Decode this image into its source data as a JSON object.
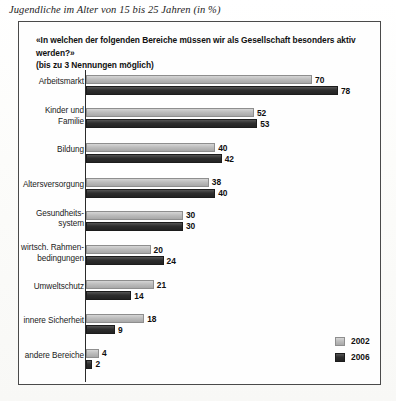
{
  "caption": "Jugendliche im Alter von 15 bis 25 Jahren (in %)",
  "question": {
    "line1": "«In welchen der folgenden Bereiche müssen wir als Gesellschaft besonders aktiv werden?»",
    "line2": "(bis zu 3 Nennungen möglich)"
  },
  "legend": {
    "items": [
      {
        "label": "2002",
        "color": "#bdbdbd"
      },
      {
        "label": "2006",
        "color": "#2e2e2e"
      }
    ]
  },
  "chart_data": {
    "type": "bar",
    "orientation": "horizontal",
    "title": "«In welchen der folgenden Bereiche müssen wir als Gesellschaft besonders aktiv werden?»",
    "subtitle": "(bis zu 3 Nennungen möglich)",
    "caption": "Jugendliche im Alter von 15 bis 25 Jahren (in %)",
    "xlabel": "",
    "ylabel": "",
    "unit": "%",
    "xlim": [
      0,
      78
    ],
    "grid": false,
    "legend_position": "bottom-right",
    "categories": [
      "Arbeitsmarkt",
      "Kinder und Familie",
      "Bildung",
      "Altersversorgung",
      "Gesundheits-system",
      "wirtsch. Rahmen-bedingungen",
      "Umweltschutz",
      "innere Sicherheit",
      "andere Bereiche"
    ],
    "series": [
      {
        "name": "2002",
        "values": [
          70,
          52,
          40,
          38,
          30,
          20,
          21,
          18,
          4
        ]
      },
      {
        "name": "2006",
        "values": [
          78,
          53,
          42,
          40,
          30,
          24,
          14,
          9,
          2
        ]
      }
    ]
  },
  "rows": [
    {
      "label_line1": "Arbeitsmarkt",
      "label_line2": "",
      "v2002": 70,
      "v2006": 78
    },
    {
      "label_line1": "Kinder und",
      "label_line2": "Familie",
      "v2002": 52,
      "v2006": 53
    },
    {
      "label_line1": "Bildung",
      "label_line2": "",
      "v2002": 40,
      "v2006": 42
    },
    {
      "label_line1": "Altersversorgung",
      "label_line2": "",
      "v2002": 38,
      "v2006": 40
    },
    {
      "label_line1": "Gesundheits-",
      "label_line2": "system",
      "v2002": 30,
      "v2006": 30
    },
    {
      "label_line1": "wirtsch. Rahmen-",
      "label_line2": "bedingungen",
      "v2002": 20,
      "v2006": 24
    },
    {
      "label_line1": "Umweltschutz",
      "label_line2": "",
      "v2002": 21,
      "v2006": 14
    },
    {
      "label_line1": "innere Sicherheit",
      "label_line2": "",
      "v2002": 18,
      "v2006": 9
    },
    {
      "label_line1": "andere Bereiche",
      "label_line2": "",
      "v2002": 4,
      "v2006": 2
    }
  ]
}
